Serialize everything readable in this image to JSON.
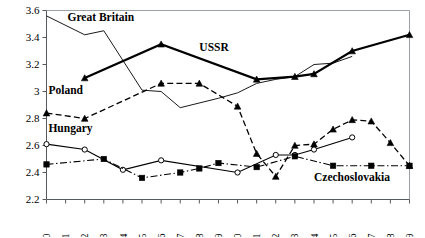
{
  "chart_data": {
    "type": "line",
    "title": "",
    "subtitle": "",
    "xlabel": "",
    "ylabel": "",
    "xlim": [
      1970,
      1989
    ],
    "ylim": [
      2.2,
      3.6
    ],
    "grid": false,
    "legend_position": "inline-annotations",
    "x": [
      1970,
      1971,
      1972,
      1973,
      1974,
      1975,
      1976,
      1977,
      1978,
      1979,
      1980,
      1981,
      1982,
      1983,
      1984,
      1985,
      1986,
      1987,
      1988,
      1989
    ],
    "xticklabels": [
      "1970",
      "1971",
      "1972",
      "1973",
      "1974",
      "1975",
      "1976",
      "1977",
      "1978",
      "1979",
      "1980",
      "1981",
      "1982",
      "1983",
      "1984",
      "1985",
      "1986",
      "1987",
      "1988",
      "1989"
    ],
    "yticks": [
      2.2,
      2.4,
      2.6,
      2.8,
      3.0,
      3.2,
      3.4,
      3.6
    ],
    "yticklabels": [
      "2.2",
      "2.4",
      "2.6",
      "2.8",
      "3",
      "3.2",
      "3.4",
      "3.6"
    ],
    "series": [
      {
        "name": "Great Britain",
        "label": "Great Britain",
        "marker": "none",
        "linestyle": "solid",
        "linewidth": 1,
        "color": "#1a1a1a",
        "label_x": 1971.1,
        "label_y": 3.52,
        "x": [
          1970,
          1972,
          1973,
          1975,
          1976,
          1977,
          1979,
          1980,
          1981,
          1982,
          1983,
          1984,
          1985,
          1986
        ],
        "values": [
          3.56,
          3.42,
          3.45,
          3.01,
          3.0,
          2.88,
          2.95,
          2.99,
          3.06,
          3.09,
          3.11,
          3.2,
          3.21,
          3.26
        ]
      },
      {
        "name": "USSR",
        "label": "USSR",
        "marker": "triangle-filled",
        "linestyle": "solid",
        "linewidth": 2.2,
        "color": "#000000",
        "label_x": 1978.0,
        "label_y": 3.3,
        "x": [
          1972,
          1976,
          1981,
          1983,
          1984,
          1986,
          1989
        ],
        "values": [
          3.1,
          3.35,
          3.09,
          3.11,
          3.13,
          3.3,
          3.42
        ]
      },
      {
        "name": "Poland",
        "label": "Poland",
        "marker": "triangle-filled",
        "linestyle": "dashed",
        "linewidth": 1.3,
        "color": "#000000",
        "label_x": 1970.1,
        "label_y": 2.98,
        "x": [
          1970,
          1972,
          1976,
          1978,
          1980,
          1981,
          1982,
          1983,
          1984,
          1985,
          1986,
          1987,
          1988,
          1989
        ],
        "values": [
          2.84,
          2.8,
          3.06,
          3.06,
          2.89,
          2.54,
          2.37,
          2.6,
          2.61,
          2.72,
          2.79,
          2.78,
          2.62,
          2.45
        ]
      },
      {
        "name": "Hungary",
        "label": "Hungary",
        "marker": "circle-open",
        "linestyle": "solid",
        "linewidth": 1.1,
        "color": "#000000",
        "label_x": 1970.1,
        "label_y": 2.7,
        "x": [
          1970,
          1972,
          1974,
          1976,
          1980,
          1982,
          1983,
          1984,
          1986
        ],
        "values": [
          2.61,
          2.57,
          2.42,
          2.49,
          2.4,
          2.53,
          2.53,
          2.57,
          2.66
        ]
      },
      {
        "name": "Czechoslovakia",
        "label": "Czechoslovakia",
        "marker": "square-filled",
        "linestyle": "dashdot",
        "linewidth": 1.1,
        "color": "#000000",
        "label_x": 1984.0,
        "label_y": 2.34,
        "x": [
          1970,
          1973,
          1975,
          1977,
          1978,
          1979,
          1981,
          1983,
          1985,
          1987,
          1989
        ],
        "values": [
          2.46,
          2.5,
          2.36,
          2.4,
          2.43,
          2.47,
          2.44,
          2.52,
          2.45,
          2.45,
          2.45
        ]
      }
    ]
  }
}
